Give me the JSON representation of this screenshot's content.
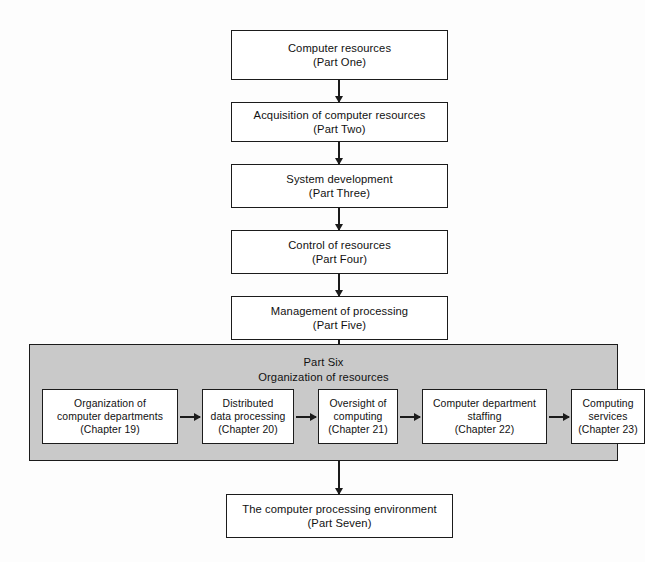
{
  "diagram": {
    "colors": {
      "panel_fill": "#c9c9c9",
      "box_fill": "#ffffff",
      "stroke": "#1b1b1b",
      "background": "#fdfdfd"
    },
    "parts": [
      {
        "line1": "Computer resources",
        "line2": "(Part One)"
      },
      {
        "line1": "Acquisition of computer resources",
        "line2": "(Part Two)"
      },
      {
        "line1": "System development",
        "line2": "(Part Three)"
      },
      {
        "line1": "Control of resources",
        "line2": "(Part Four)"
      },
      {
        "line1": "Management of processing",
        "line2": "(Part Five)"
      }
    ],
    "part_six": {
      "heading_line1": "Part Six",
      "heading_line2": "Organization of resources",
      "chapters": [
        {
          "line1": "Organization of",
          "line2": "computer departments",
          "line3": "(Chapter 19)"
        },
        {
          "line1": "Distributed",
          "line2": "data processing",
          "line3": "(Chapter 20)"
        },
        {
          "line1": "Oversight of",
          "line2": "computing",
          "line3": "(Chapter 21)"
        },
        {
          "line1": "Computer department",
          "line2": "staffing",
          "line3": "(Chapter 22)"
        },
        {
          "line1": "Computing",
          "line2": "services",
          "line3": "(Chapter 23)"
        }
      ]
    },
    "final_part": {
      "line1": "The computer processing environment",
      "line2": "(Part Seven)"
    }
  }
}
